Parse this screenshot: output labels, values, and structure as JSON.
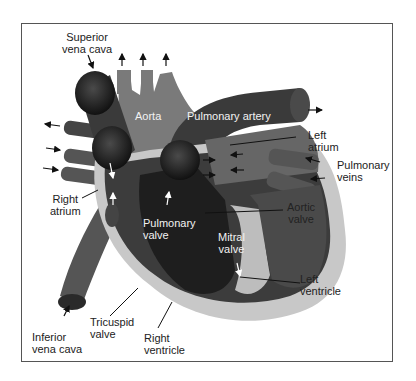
{
  "diagram": {
    "colors": {
      "background": "#ffffff",
      "frame": "#555555",
      "vessel_dark": "#3a3a3a",
      "vessel_mid": "#6e6e6e",
      "aorta": "#7a7a7a",
      "chamber_dark": "#222222",
      "wall_light": "#c8c8c8",
      "wall_highlight": "#e6e6e6",
      "label_dark": "#222222",
      "label_light": "#f2f2f2"
    },
    "labels": {
      "superior_vena_cava": "Superior\nvena cava",
      "aorta": "Aorta",
      "pulmonary_artery": "Pulmonary artery",
      "left_atrium": "Left\natrium",
      "pulmonary_veins": "Pulmonary\nveins",
      "right_atrium": "Right\natrium",
      "pulmonary_valve": "Pulmonary\nvalve",
      "aortic_valve": "Aortic\nvalve",
      "mitral_valve": "Mitral\nvalve",
      "left_ventricle": "Left\nventricle",
      "inferior_vena_cava": "Inferior\nvena cava",
      "tricuspid_valve": "Tricuspid\nvalve",
      "right_ventricle": "Right\nventricle"
    }
  }
}
